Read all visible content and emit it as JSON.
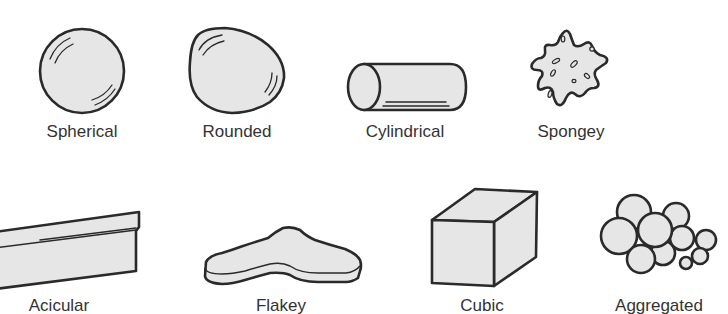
{
  "diagram": {
    "type": "particle-shape-classification",
    "colors": {
      "fill": "#e6e6e6",
      "outline": "#2a2a2a",
      "label": "#333333",
      "background": "#ffffff"
    },
    "rows": [
      {
        "shapes": [
          {
            "id": "spherical",
            "label": "Spherical"
          },
          {
            "id": "rounded",
            "label": "Rounded"
          },
          {
            "id": "cylindrical",
            "label": "Cylindrical"
          },
          {
            "id": "spongey",
            "label": "Spongey"
          }
        ]
      },
      {
        "shapes": [
          {
            "id": "acicular",
            "label": "Acicular"
          },
          {
            "id": "flakey",
            "label": "Flakey"
          },
          {
            "id": "cubic",
            "label": "Cubic"
          },
          {
            "id": "aggregated",
            "label": "Aggregated"
          }
        ]
      }
    ]
  }
}
